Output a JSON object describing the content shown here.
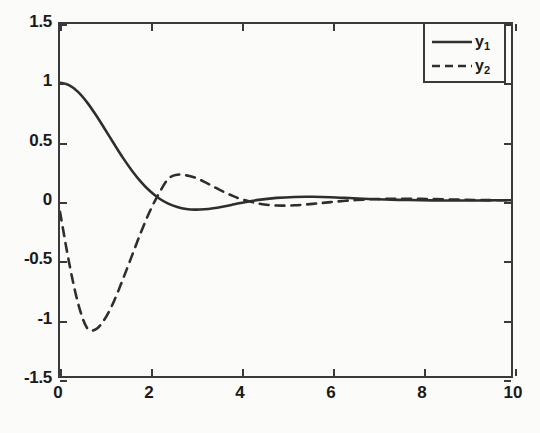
{
  "chart_data": {
    "type": "line",
    "title": "",
    "xlabel": "",
    "ylabel": "",
    "xlim": [
      0,
      10
    ],
    "ylim": [
      -1.5,
      1.5
    ],
    "grid": false,
    "legend_position": "top-right",
    "x_ticks": [
      "0",
      "2",
      "4",
      "6",
      "8",
      "10"
    ],
    "x_tick_values": [
      0,
      2,
      4,
      6,
      8,
      10
    ],
    "y_ticks": [
      "1.5",
      "1",
      "0.5",
      "0",
      "-0.5",
      "-1",
      "-1.5"
    ],
    "y_tick_values": [
      1.5,
      1,
      0.5,
      0,
      -0.5,
      -1,
      -1.5
    ],
    "series": [
      {
        "name": "y_1",
        "label_base": "y",
        "label_sub": "1",
        "style": "solid",
        "color": "#2e2e2e",
        "x": [
          0,
          0.2,
          0.4,
          0.6,
          0.8,
          1.0,
          1.2,
          1.4,
          1.6,
          1.8,
          2.0,
          2.2,
          2.4,
          2.6,
          2.8,
          3.0,
          3.2,
          3.4,
          3.6,
          3.8,
          4.0,
          4.4,
          4.8,
          5.2,
          5.6,
          6.0,
          6.5,
          7.0,
          7.5,
          8.0,
          8.5,
          9.0,
          9.5,
          10.0
        ],
        "values": [
          1.0,
          0.979,
          0.921,
          0.832,
          0.722,
          0.601,
          0.477,
          0.357,
          0.248,
          0.153,
          0.074,
          0.013,
          -0.031,
          -0.06,
          -0.077,
          -0.082,
          -0.079,
          -0.07,
          -0.057,
          -0.042,
          -0.026,
          0.001,
          0.018,
          0.026,
          0.027,
          0.024,
          0.015,
          0.007,
          0.001,
          -0.002,
          -0.004,
          -0.004,
          -0.003,
          -0.002
        ]
      },
      {
        "name": "y_2",
        "label_base": "y",
        "label_sub": "2",
        "style": "dashed",
        "color": "#2e2e2e",
        "x": [
          0,
          0.2,
          0.4,
          0.6,
          0.8,
          1.0,
          1.2,
          1.4,
          1.6,
          1.8,
          2.0,
          2.2,
          2.4,
          2.6,
          2.8,
          3.0,
          3.2,
          3.4,
          3.6,
          3.8,
          4.0,
          4.4,
          4.8,
          5.2,
          5.6,
          6.0,
          6.5,
          7.0,
          7.5,
          8.0,
          8.5,
          9.0,
          9.5,
          10.0
        ],
        "values": [
          -0.1,
          -0.53,
          -0.88,
          -1.09,
          -1.1,
          -1.01,
          -0.86,
          -0.67,
          -0.47,
          -0.27,
          -0.09,
          0.06,
          0.18,
          0.215,
          0.21,
          0.19,
          0.155,
          0.115,
          0.075,
          0.04,
          0.01,
          -0.03,
          -0.047,
          -0.045,
          -0.033,
          -0.018,
          -0.002,
          0.008,
          0.011,
          0.01,
          0.006,
          0.002,
          -0.001,
          -0.002
        ]
      }
    ]
  },
  "axes": {
    "frame_color": "#3a3a3a",
    "background": "#fbfbf9"
  }
}
